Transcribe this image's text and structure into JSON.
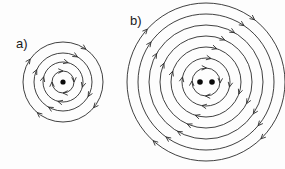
{
  "figure": {
    "background_color": "#fdfdfd",
    "stroke_color": "#2b2b2b",
    "dot_color": "#0a0a0a",
    "label_color": "#1a1a1a",
    "width": 285,
    "height": 169
  },
  "chart_data": {
    "type": "diagram",
    "title": "",
    "subtitle": "",
    "xlabel": "",
    "ylabel": "",
    "grid": false,
    "legend": "none",
    "panels": [
      {
        "label": "a)",
        "label_x": 16,
        "label_y": 48,
        "center_x": 63,
        "center_y": 82,
        "circle_count": 4,
        "circle_radii": [
          11,
          20,
          29,
          40
        ],
        "rotation": "clockwise",
        "wire_count": 1,
        "wire_dots": [
          {
            "cx": 63,
            "cy": 82,
            "r": 2.6
          }
        ],
        "arrows": [
          {
            "radius_index": 0,
            "angle_deg": 270
          },
          {
            "radius_index": 0,
            "angle_deg": 0
          },
          {
            "radius_index": 0,
            "angle_deg": 90
          },
          {
            "radius_index": 0,
            "angle_deg": 180
          },
          {
            "radius_index": 1,
            "angle_deg": 285
          },
          {
            "radius_index": 1,
            "angle_deg": 15
          },
          {
            "radius_index": 1,
            "angle_deg": 105
          },
          {
            "radius_index": 1,
            "angle_deg": 195
          },
          {
            "radius_index": 2,
            "angle_deg": 300
          },
          {
            "radius_index": 2,
            "angle_deg": 30
          },
          {
            "radius_index": 2,
            "angle_deg": 120
          },
          {
            "radius_index": 2,
            "angle_deg": 205
          },
          {
            "radius_index": 3,
            "angle_deg": 305
          },
          {
            "radius_index": 3,
            "angle_deg": 40
          },
          {
            "radius_index": 3,
            "angle_deg": 130
          },
          {
            "radius_index": 3,
            "angle_deg": 215
          }
        ]
      },
      {
        "label": "b)",
        "label_x": 130,
        "label_y": 25,
        "center_x": 206,
        "center_y": 82,
        "circle_count": 7,
        "circle_radii": [
          14,
          24,
          35,
          46,
          57,
          68,
          79
        ],
        "rotation": "clockwise",
        "wire_count": 2,
        "wire_dots": [
          {
            "cx": 200,
            "cy": 82,
            "r": 2.8
          },
          {
            "cx": 212,
            "cy": 82,
            "r": 2.8
          }
        ],
        "arrows": [
          {
            "radius_index": 0,
            "angle_deg": 272
          },
          {
            "radius_index": 0,
            "angle_deg": 4
          },
          {
            "radius_index": 0,
            "angle_deg": 92
          },
          {
            "radius_index": 0,
            "angle_deg": 184
          },
          {
            "radius_index": 1,
            "angle_deg": 282
          },
          {
            "radius_index": 1,
            "angle_deg": 12
          },
          {
            "radius_index": 1,
            "angle_deg": 100
          },
          {
            "radius_index": 1,
            "angle_deg": 192
          },
          {
            "radius_index": 2,
            "angle_deg": 288
          },
          {
            "radius_index": 2,
            "angle_deg": 20
          },
          {
            "radius_index": 2,
            "angle_deg": 108
          },
          {
            "radius_index": 2,
            "angle_deg": 198
          },
          {
            "radius_index": 3,
            "angle_deg": 294
          },
          {
            "radius_index": 3,
            "angle_deg": 28
          },
          {
            "radius_index": 3,
            "angle_deg": 114
          },
          {
            "radius_index": 3,
            "angle_deg": 204
          },
          {
            "radius_index": 4,
            "angle_deg": 300
          },
          {
            "radius_index": 4,
            "angle_deg": 34
          },
          {
            "radius_index": 4,
            "angle_deg": 120
          },
          {
            "radius_index": 4,
            "angle_deg": 210
          },
          {
            "radius_index": 5,
            "angle_deg": 304
          },
          {
            "radius_index": 5,
            "angle_deg": 40
          },
          {
            "radius_index": 5,
            "angle_deg": 126
          },
          {
            "radius_index": 5,
            "angle_deg": 216
          },
          {
            "radius_index": 6,
            "angle_deg": 308
          },
          {
            "radius_index": 6,
            "angle_deg": 46
          },
          {
            "radius_index": 6,
            "angle_deg": 132
          },
          {
            "radius_index": 6,
            "angle_deg": 222
          }
        ]
      }
    ]
  }
}
